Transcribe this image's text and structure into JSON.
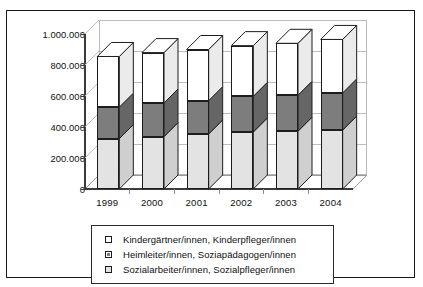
{
  "figure": {
    "frame_border_color": "#1a1a1a",
    "background": "#ffffff",
    "top_clipped_text": ""
  },
  "chart_data": {
    "type": "bar",
    "subtype": "stacked-column-3d",
    "title": "",
    "subtitle": "",
    "xlabel": "",
    "ylabel": "",
    "categories": [
      "1999",
      "2000",
      "2001",
      "2002",
      "2003",
      "2004"
    ],
    "ylim": [
      0,
      1000000
    ],
    "ytick_values": [
      0,
      200000,
      400000,
      600000,
      800000,
      1000000
    ],
    "ytick_labels": [
      "0",
      "200.000",
      "400.000",
      "600.000",
      "800.000",
      "1.000.000"
    ],
    "grid": true,
    "grid_axis": "y",
    "legend_position": "bottom",
    "stack_order_bottom_to_top": [
      "Sozialarbeiter/innen, Sozialpfleger/innen",
      "Heimleiter/innen, Soziapädagogen/innen",
      "Kindergärtner/innen, Kinderpfleger/innen"
    ],
    "series": [
      {
        "name": "Sozialarbeiter/innen, Sozialpfleger/innen",
        "color": "#e3e3e3",
        "side_color": "#cfcfcf",
        "top_color": "#f2f2f2",
        "values": [
          325000,
          338000,
          355000,
          368000,
          373000,
          380000
        ]
      },
      {
        "name": "Heimleiter/innen, Soziapädagogen/innen",
        "color": "#7d7d7d",
        "side_color": "#666666",
        "top_color": "#949494",
        "values": [
          203000,
          217000,
          215000,
          230000,
          232000,
          240000
        ]
      },
      {
        "name": "Kindergärtner/innen, Kinderpfleger/innen",
        "color": "#ffffff",
        "side_color": "#ebebeb",
        "top_color": "#ffffff",
        "values": [
          327000,
          325000,
          330000,
          327000,
          335000,
          345000
        ]
      }
    ],
    "stack_tops": {
      "series_1_top": [
        325000,
        338000,
        355000,
        368000,
        373000,
        380000
      ],
      "series_2_top": [
        528000,
        555000,
        570000,
        598000,
        605000,
        620000
      ],
      "series_3_top": [
        855000,
        880000,
        900000,
        925000,
        940000,
        965000
      ]
    }
  },
  "legend": {
    "items": [
      {
        "label": "Kindergärtner/innen, Kinderpfleger/innen",
        "marker": "open-square-swatch",
        "fill": "#ffffff"
      },
      {
        "label": "Heimleiter/innen, Soziapädagogen/innen",
        "marker": "filled-square-swatch",
        "fill": "#7d7d7d"
      },
      {
        "label": "Sozialarbeiter/innen, Sozialpfleger/innen",
        "marker": "open-square-swatch",
        "fill": "#e3e3e3"
      }
    ]
  }
}
